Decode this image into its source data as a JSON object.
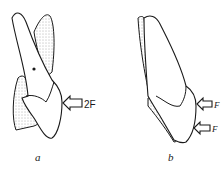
{
  "figure": {
    "panels": [
      {
        "id": "a",
        "caption": "a",
        "force_label": "2F",
        "force_arrows": 1
      },
      {
        "id": "b",
        "caption": "b",
        "force_labels": [
          "F",
          "F"
        ],
        "force_arrows": 2
      }
    ],
    "colors": {
      "stroke": "#1a1a1a",
      "fill": "#ffffff",
      "stipple": "#555555"
    }
  }
}
